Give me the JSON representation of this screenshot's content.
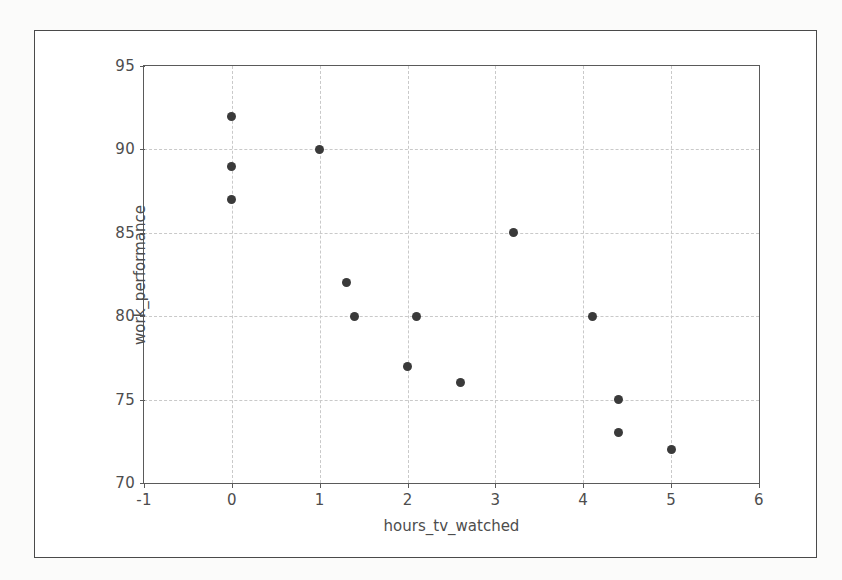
{
  "figure": {
    "background_color": "#fbfbfa",
    "plot_background_color": "#ffffff",
    "frame_color": "#4a4a4a",
    "marker_color": "#3a3a3a",
    "grid_color": "#c9c9c9"
  },
  "chart_data": {
    "type": "scatter",
    "title": "",
    "xlabel": "hours_tv_watched",
    "ylabel": "work_performance",
    "xlim": [
      -1,
      6
    ],
    "ylim": [
      70,
      95
    ],
    "xticks": [
      -1,
      0,
      1,
      2,
      3,
      4,
      5,
      6
    ],
    "xtick_labels": [
      "-1",
      "0",
      "1",
      "2",
      "3",
      "4",
      "5",
      "6"
    ],
    "yticks": [
      70,
      75,
      80,
      85,
      90,
      95
    ],
    "ytick_labels": [
      "70",
      "75",
      "80",
      "85",
      "90",
      "95"
    ],
    "grid": true,
    "grid_style": "dashed",
    "legend": null,
    "marker": "circle",
    "marker_size": 9,
    "points": [
      {
        "x": 0.0,
        "y": 92
      },
      {
        "x": 0.0,
        "y": 89
      },
      {
        "x": 0.0,
        "y": 87
      },
      {
        "x": 1.0,
        "y": 90
      },
      {
        "x": 1.3,
        "y": 82
      },
      {
        "x": 1.4,
        "y": 80
      },
      {
        "x": 2.0,
        "y": 77
      },
      {
        "x": 2.1,
        "y": 80
      },
      {
        "x": 2.6,
        "y": 76
      },
      {
        "x": 3.2,
        "y": 85
      },
      {
        "x": 4.1,
        "y": 80
      },
      {
        "x": 4.4,
        "y": 75
      },
      {
        "x": 4.4,
        "y": 73
      },
      {
        "x": 5.0,
        "y": 72
      }
    ]
  }
}
